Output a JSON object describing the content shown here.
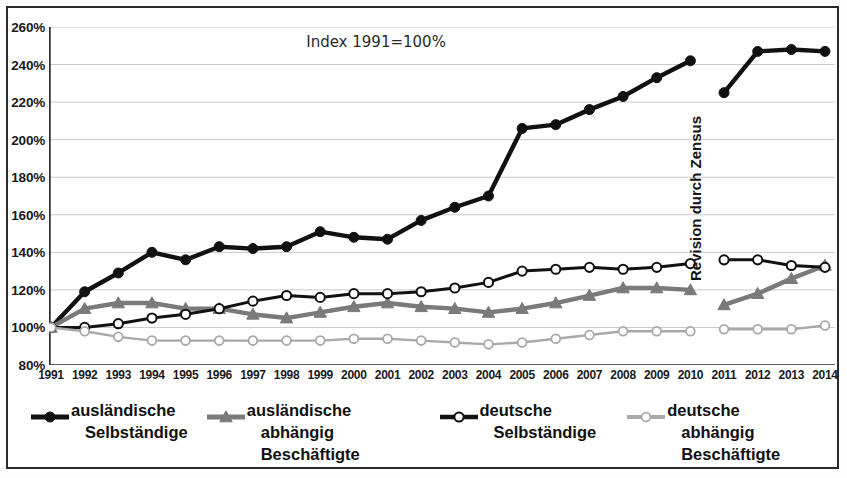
{
  "annotations": {
    "index_note": "Index 1991=100%",
    "revision_note": "Revision durch Zensus"
  },
  "axis": {
    "y_ticks": [
      "80%",
      "100%",
      "120%",
      "140%",
      "160%",
      "180%",
      "200%",
      "220%",
      "240%",
      "260%"
    ],
    "x_ticks": [
      "1991",
      "1992",
      "1993",
      "1994",
      "1995",
      "1996",
      "1997",
      "1998",
      "1999",
      "2000",
      "2001",
      "2002",
      "2003",
      "2004",
      "2005",
      "2006",
      "2007",
      "2008",
      "2009",
      "2010",
      "2011",
      "2012",
      "2013",
      "2014"
    ]
  },
  "legend": [
    {
      "label_line1": "ausländische",
      "label_line2": "Selbständige",
      "marker": "filled-circle",
      "color": "#111111"
    },
    {
      "label_line1": "ausländische",
      "label_line2": "abhängig Beschäftigte",
      "marker": "filled-triangle",
      "color": "#7a7a7a"
    },
    {
      "label_line1": "deutsche",
      "label_line2": "Selbständige",
      "marker": "open-circle",
      "color": "#111111"
    },
    {
      "label_line1": "deutsche",
      "label_line2": "abhängig Beschäftigte",
      "marker": "open-circle-grey",
      "color": "#a9a9a9"
    }
  ],
  "colors": {
    "black": "#111111",
    "grey_dark": "#7a7a7a",
    "grey_light": "#a9a9a9",
    "frame": "#2b2b2b",
    "gridline": "#c9c9c9"
  },
  "chart_data": {
    "type": "line",
    "title": "Index 1991=100%",
    "xlabel": "",
    "ylabel": "",
    "ylim": [
      80,
      260
    ],
    "ytick_step": 20,
    "grid": true,
    "legend_position": "bottom",
    "x": [
      1991,
      1992,
      1993,
      1994,
      1995,
      1996,
      1997,
      1998,
      1999,
      2000,
      2001,
      2002,
      2003,
      2004,
      2005,
      2006,
      2007,
      2008,
      2009,
      2010,
      2011,
      2012,
      2013,
      2014
    ],
    "break_after": 2010,
    "break_note": "Revision durch Zensus",
    "series": [
      {
        "name": "ausländische Selbständige",
        "marker": "filled-circle",
        "color": "#111111",
        "values": [
          100,
          119,
          129,
          140,
          136,
          143,
          142,
          143,
          151,
          148,
          147,
          157,
          164,
          170,
          206,
          208,
          216,
          223,
          233,
          242,
          225,
          247,
          248,
          247
        ]
      },
      {
        "name": "ausländische abhängig Beschäftigte",
        "marker": "filled-triangle",
        "color": "#7a7a7a",
        "values": [
          100,
          110,
          113,
          113,
          110,
          110,
          107,
          105,
          108,
          111,
          113,
          111,
          110,
          108,
          110,
          113,
          117,
          121,
          121,
          120,
          112,
          118,
          126,
          133
        ]
      },
      {
        "name": "deutsche Selbständige",
        "marker": "open-circle",
        "color": "#111111",
        "values": [
          100,
          100,
          102,
          105,
          107,
          110,
          114,
          117,
          116,
          118,
          118,
          119,
          121,
          124,
          130,
          131,
          132,
          131,
          132,
          134,
          136,
          136,
          133,
          132
        ]
      },
      {
        "name": "deutsche abhängig Beschäftigte",
        "marker": "open-circle-grey",
        "color": "#a9a9a9",
        "values": [
          100,
          98,
          95,
          93,
          93,
          93,
          93,
          93,
          93,
          94,
          94,
          93,
          92,
          91,
          92,
          94,
          96,
          98,
          98,
          98,
          99,
          99,
          99,
          101
        ]
      }
    ]
  }
}
